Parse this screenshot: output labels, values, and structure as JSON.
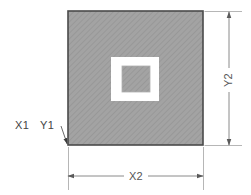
{
  "diagram": {
    "background_color": "#ffffff",
    "labels": {
      "origin_x": "X1",
      "origin_y": "Y1",
      "width_dim": "X2",
      "height_dim": "Y2"
    },
    "colors": {
      "fill_gray": "#a0a0a0",
      "hatch_line": "#8d8d8d",
      "outline": "#4a4a4a",
      "cutout_white": "#ffffff",
      "dimension_line": "#8a8a8a",
      "extension_line": "#b4b4b4",
      "leader_line": "#6a6a6a",
      "text": "#4a4a4a"
    },
    "geometry": {
      "outer_square": {
        "x": 68,
        "y": 11,
        "width": 135,
        "height": 134
      },
      "cutout_frame": {
        "x": 111,
        "y": 57,
        "width": 48,
        "height": 44
      },
      "inner_island": {
        "x": 122,
        "y": 66,
        "width": 28,
        "height": 26
      },
      "x2_dimension_line_y": 176,
      "y2_dimension_line_x": 229,
      "leader_start": {
        "x": 62,
        "y": 126
      },
      "leader_end": {
        "x": 68,
        "y": 145
      }
    }
  }
}
